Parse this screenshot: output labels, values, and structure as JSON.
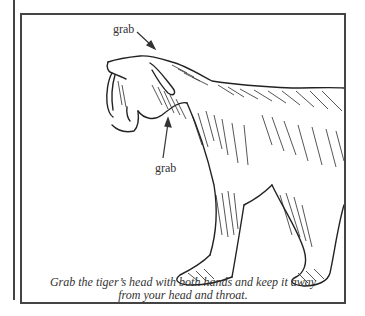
{
  "illustration": {
    "subject": "saber-toothed tiger",
    "labels": [
      {
        "text": "grab",
        "target": "top of head"
      },
      {
        "text": "grab",
        "target": "throat"
      }
    ],
    "caption": {
      "line1": "Grab the tiger’s head with both hands and keep it away",
      "line2": "from your head and throat."
    },
    "colors": {
      "ink": "#333333",
      "frame": "#444444",
      "paper": "#ffffff"
    }
  }
}
